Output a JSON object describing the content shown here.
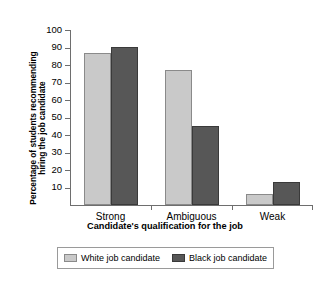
{
  "chart_data": {
    "type": "bar",
    "title": "",
    "xlabel": "Candidate's qualification for the job",
    "ylabel_line1": "Percentage of students recommending",
    "ylabel_line2": "hiring the job candidate",
    "categories": [
      "Strong",
      "Ambiguous",
      "Weak"
    ],
    "series": [
      {
        "name": "White job candidate",
        "values": [
          87,
          77,
          6.5
        ],
        "color": "#c9c9c9"
      },
      {
        "name": "Black job candidate",
        "values": [
          90.5,
          45,
          13
        ],
        "color": "#575757"
      }
    ],
    "ylim": [
      0,
      100
    ],
    "yticks": [
      10,
      20,
      30,
      40,
      50,
      60,
      70,
      80,
      90,
      100
    ],
    "grid": false,
    "legend_position": "bottom"
  },
  "legend": {
    "items": [
      {
        "label": "White job candidate"
      },
      {
        "label": "Black job candidate"
      }
    ]
  }
}
